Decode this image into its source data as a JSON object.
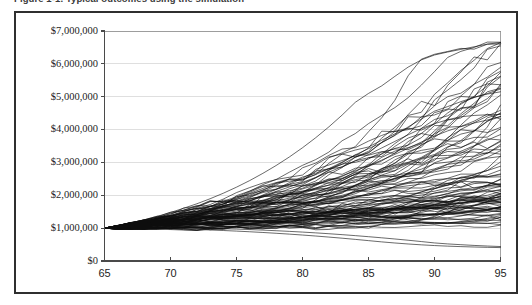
{
  "figure": {
    "caption": "Figure 1-1.  Typical outcomes using the simulation",
    "frame_color": "#2f2f2f"
  },
  "chart_data": {
    "type": "line",
    "title": "",
    "subtitle": "",
    "xlabel": "",
    "ylabel": "",
    "xlim": [
      65,
      95
    ],
    "ylim": [
      0,
      7000000
    ],
    "grid": true,
    "legend_position": "none",
    "series_color": "#0d0d0d",
    "x_tick_labels": [
      "65",
      "70",
      "75",
      "80",
      "85",
      "90",
      "95"
    ],
    "x_ticks": [
      65,
      70,
      75,
      80,
      85,
      90,
      95
    ],
    "y_tick_labels": [
      "$7,000,000",
      "$6,000,000",
      "$5,000,000",
      "$4,000,000",
      "$3,000,000",
      "$2,000,000",
      "$1,000,000",
      "$0"
    ],
    "y_ticks": [
      7000000,
      6000000,
      5000000,
      4000000,
      3000000,
      2000000,
      1000000,
      0
    ],
    "x": [
      65,
      66,
      67,
      68,
      69,
      70,
      71,
      72,
      73,
      74,
      75,
      76,
      77,
      78,
      79,
      80,
      81,
      82,
      83,
      84,
      85,
      86,
      87,
      88,
      89,
      90,
      91,
      92,
      93,
      94,
      95
    ],
    "start_value": 1000000,
    "n_series": 100,
    "series": [
      {
        "name": "trial-1",
        "values": [
          1000000,
          1072000,
          1163000,
          1252000,
          1359000,
          1478000,
          1606000,
          1742000,
          1895000,
          2063000,
          2247000,
          2448000,
          2668000,
          2906000,
          3165000,
          3447000,
          3752000,
          4083000,
          4441000,
          4830000,
          5100000,
          5330000,
          5620000,
          5900000,
          6120000,
          6270000,
          6360000,
          6440000,
          6520000,
          6600000,
          6650000
        ]
      },
      {
        "name": "trial-2",
        "values": [
          1000000,
          1058000,
          1128000,
          1196000,
          1276000,
          1364000,
          1458000,
          1558000,
          1668000,
          1788000,
          1918000,
          2058000,
          2210000,
          2372000,
          2430000,
          2470000,
          2630000,
          2810000,
          3010000,
          3230000,
          3420000,
          3600000,
          3820000,
          4080000,
          4320000,
          4560000,
          4700000,
          4850000,
          4980000,
          5080000,
          5150000
        ]
      },
      {
        "name": "trial-3",
        "values": [
          1000000,
          1050000,
          1108000,
          1168000,
          1236000,
          1310000,
          1390000,
          1474000,
          1564000,
          1660000,
          1764000,
          1874000,
          1992000,
          2118000,
          2252000,
          2394000,
          2544000,
          2704000,
          2872000,
          3050000,
          3240000,
          3440000,
          3640000,
          3840000,
          4030000,
          4180000,
          4300000,
          4390000,
          4430000,
          4450000,
          4460000
        ]
      },
      {
        "name": "trial-4",
        "values": [
          1000000,
          1046000,
          1096000,
          1150000,
          1208000,
          1272000,
          1340000,
          1412000,
          1490000,
          1572000,
          1660000,
          1754000,
          1854000,
          1960000,
          2072000,
          2192000,
          2318000,
          2452000,
          2594000,
          2744000,
          2902000,
          3070000,
          3246000,
          3430000,
          3620000,
          3800000,
          3960000,
          4090000,
          4200000,
          4290000,
          4400000
        ]
      },
      {
        "name": "trial-50",
        "values": [
          1000000,
          1030000,
          1062000,
          1094000,
          1128000,
          1162000,
          1198000,
          1234000,
          1272000,
          1310000,
          1350000,
          1390000,
          1432000,
          1474000,
          1518000,
          1562000,
          1608000,
          1654000,
          1702000,
          1750000,
          1800000,
          1850000,
          1902000,
          1954000,
          2008000,
          2062000,
          2118000,
          2174000,
          2232000,
          2290000,
          2350000
        ]
      },
      {
        "name": "trial-95",
        "values": [
          1000000,
          1006000,
          1010000,
          1012000,
          1012000,
          1010000,
          1006000,
          1000000,
          992000,
          982000,
          970000,
          956000,
          940000,
          922000,
          902000,
          880000,
          856000,
          830000,
          802000,
          772000,
          740000,
          706000,
          670000,
          632000,
          592000,
          550000,
          520000,
          496000,
          474000,
          456000,
          440000
        ]
      },
      {
        "name": "trial-100",
        "values": [
          1000000,
          1000000,
          998000,
          994000,
          988000,
          980000,
          970000,
          958000,
          944000,
          928000,
          910000,
          890000,
          868000,
          844000,
          818000,
          790000,
          760000,
          728000,
          694000,
          658000,
          620000,
          582000,
          548000,
          518000,
          492000,
          470000,
          452000,
          438000,
          426000,
          416000,
          408000
        ]
      }
    ]
  }
}
